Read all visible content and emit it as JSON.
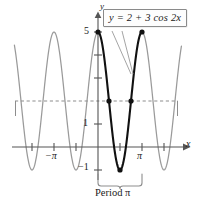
{
  "figure": {
    "equation_label": "y = 2 + 3 cos 2x",
    "period_caption": "Period π",
    "axis_label_x": "x",
    "axis_label_y": "y"
  },
  "ticks": {
    "y_top": "5",
    "y_one": "1",
    "y_neg_one": "−1",
    "x_pi": "π",
    "x_neg_pi": "−π"
  },
  "chart_data": {
    "type": "line",
    "title": "",
    "subtitle": "",
    "xlabel": "x",
    "ylabel": "y",
    "function": "y = 2 + 3 cos 2x",
    "amplitude": 3,
    "vertical_shift": 2,
    "period": "π",
    "frequency": 2,
    "ylim": [
      -1,
      5
    ],
    "xlim_pi_units": [
      -1.9,
      1.9
    ],
    "grid": false,
    "legend": "none",
    "annotations": [
      {
        "text": "y = 2 + 3 cos 2x",
        "kind": "callout-box",
        "points_to_x_pi_units": [
          0.0,
          0.5
        ]
      },
      {
        "text": "Period π",
        "kind": "brace-below",
        "spans_x_pi_units": [
          0.0,
          1.0
        ]
      },
      {
        "text": "midline y = 2",
        "kind": "dashed-horizontal",
        "y": 2
      }
    ],
    "y_tick_values": [
      -1,
      1,
      2,
      3,
      4,
      5
    ],
    "y_tick_labels_shown": [
      "−1",
      "1",
      "5"
    ],
    "x_tick_values_pi_units": [
      -1.5,
      -1.0,
      -0.5,
      0.5,
      1.0,
      1.5
    ],
    "x_tick_labels_shown": [
      "−π",
      "π"
    ],
    "highlighted_segment": {
      "label": "one full period",
      "x_range_pi_units": [
        0.0,
        1.0
      ],
      "color": "#111111"
    },
    "marked_points": [
      {
        "x_pi_units": 0.0,
        "y": 5,
        "role": "maximum"
      },
      {
        "x_pi_units": 0.25,
        "y": 2,
        "role": "midline-crossing"
      },
      {
        "x_pi_units": 0.5,
        "y": -1,
        "role": "minimum"
      },
      {
        "x_pi_units": 0.75,
        "y": 2,
        "role": "midline-crossing"
      },
      {
        "x_pi_units": 1.0,
        "y": 5,
        "role": "maximum"
      }
    ],
    "series": [
      {
        "name": "y = 2 + 3 cos 2x (one period, bold)",
        "color": "#111111"
      },
      {
        "name": "y = 2 + 3 cos 2x (continuation, gray)",
        "color": "#9a9a9a"
      }
    ]
  },
  "colors": {
    "curve_bold": "#111111",
    "curve_light": "#9a9a9a",
    "axis": "#555555",
    "dashed": "#8d8d8d",
    "box_border": "#8a8a8a",
    "text": "#1a1a1a"
  }
}
